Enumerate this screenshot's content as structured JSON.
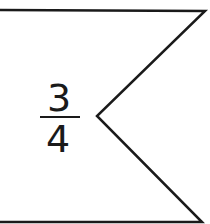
{
  "diagram": {
    "shape": "banner-flag-with-notch",
    "stroke_color": "#1a1a1a",
    "background": "#ffffff",
    "fraction": {
      "numerator": "3",
      "denominator": "4"
    }
  }
}
